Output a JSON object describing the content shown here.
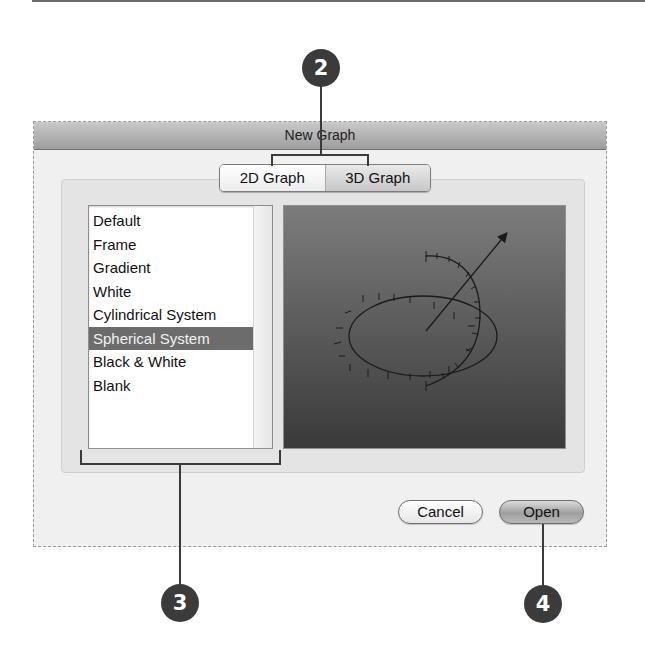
{
  "dialog": {
    "title": "New Graph",
    "tabs": [
      {
        "label": "2D Graph",
        "selected": false
      },
      {
        "label": "3D Graph",
        "selected": true
      }
    ],
    "template_list": {
      "items": [
        {
          "label": "Default"
        },
        {
          "label": "Frame"
        },
        {
          "label": "Gradient"
        },
        {
          "label": "White"
        },
        {
          "label": "Cylindrical System"
        },
        {
          "label": "Spherical System",
          "selected": true
        },
        {
          "label": "Black & White"
        },
        {
          "label": "Blank"
        }
      ]
    },
    "preview": {
      "description": "3D spherical coordinate system preview with ellipse, arc and arrow",
      "gradient_top": "#7c7c7c",
      "gradient_bottom": "#3a3a3a"
    },
    "buttons": {
      "cancel_label": "Cancel",
      "open_label": "Open"
    }
  },
  "callouts": [
    {
      "number": "2",
      "target": "tabs"
    },
    {
      "number": "3",
      "target": "template_list"
    },
    {
      "number": "4",
      "target": "open_button"
    }
  ]
}
